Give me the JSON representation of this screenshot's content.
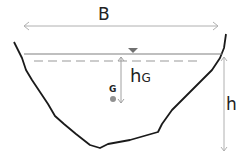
{
  "diagram": {
    "labels": {
      "width": "B",
      "depth": "h",
      "centroid_depth_main": "h",
      "centroid_depth_sub": "G",
      "centroid": "G"
    },
    "colors": {
      "outline": "#1a1a1a",
      "water_surface": "#808080",
      "dimension": "#b0b0b0",
      "centroid": "#909090"
    }
  }
}
